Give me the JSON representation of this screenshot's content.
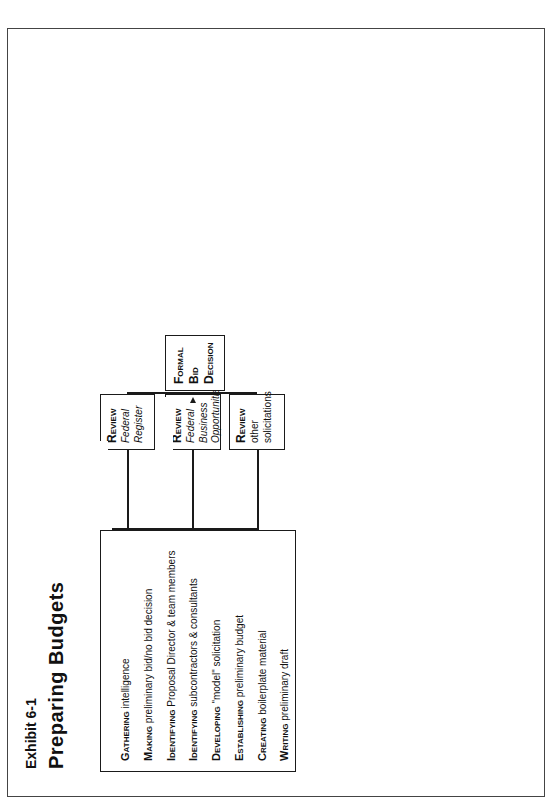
{
  "header": {
    "exhibit": "Exhibit 6-1",
    "title": "Preparing Budgets"
  },
  "preliminary_list": [
    {
      "verb": "Gathering",
      "rest": " intelligence"
    },
    {
      "verb": "Making",
      "rest": " preliminary bid/no bid decision"
    },
    {
      "verb": "Identifying",
      "rest": " Proposal Director & team members"
    },
    {
      "verb": "Identifying",
      "rest": " subcontractors & consultants"
    },
    {
      "verb": "Developing",
      "rest": " \"model\" solicitation"
    },
    {
      "verb": "Establishing",
      "rest": " preliminary budget"
    },
    {
      "verb": "Creating",
      "rest": " boilerplate material"
    },
    {
      "verb": "Writing",
      "rest": " preliminary draft"
    }
  ],
  "review_boxes": [
    {
      "verb": "Review",
      "detail": "Federal Register",
      "italic": true
    },
    {
      "verb": "Review",
      "detail": "Federal Business Opportunities",
      "italic": true
    },
    {
      "verb": "Review",
      "detail": "other solicitations",
      "italic": false
    }
  ],
  "decision": {
    "formal": [
      "Formal",
      "Bid",
      "Decision"
    ],
    "bid": "Bid",
    "no_bid": "No Bid",
    "recommend": {
      "verb": "Recommend",
      "detail": "RFP/RFA to other organizations"
    }
  },
  "bid_actions": [
    {
      "verb": "Determine",
      "detail": "availability of writers and reviewers"
    },
    {
      "verb": "Distribute",
      "detail": "RFP/RFA and proposal prospectus"
    },
    {
      "verb": "Prepare",
      "detail": "proposal compliance checklist, outline & schedule"
    }
  ],
  "strategy_meeting": {
    "title": "Strategy Meeting",
    "items": [
      {
        "verb": "Proposal",
        "rest": " prospectus"
      },
      {
        "verb": "Compliance",
        "rest": " checklist"
      },
      {
        "verb": "Proposal",
        "rest": " outline and schedule"
      },
      {
        "verb": "Subcontractor/Consultant",
        "rest": " roles"
      },
      {
        "verb": "Proposal",
        "rest": " themes"
      },
      {
        "verb": "Budget",
        "rest": " assumptions"
      },
      {
        "verb": "Questions",
        "rest": " to Government"
      }
    ]
  },
  "writing": {
    "lines": [
      {
        "verb": "Writing",
        "rest": " narrative"
      },
      {
        "verb": "Reviewing",
        "rest": " narrative"
      },
      {
        "verb": "Rewriting",
        "rest": " narrative"
      }
    ]
  },
  "budget": {
    "lines": [
      {
        "verb": "Developing",
        "rest": " budget"
      },
      {
        "verb": "Reviewing",
        "rest": " budget"
      },
      {
        "verb": "Revising",
        "rest": " budget"
      }
    ]
  },
  "final_review": {
    "lines": [
      "Final Review",
      "Sign Off",
      "Editing"
    ]
  },
  "producing": {
    "lines": [
      "Producing",
      "Reproducing",
      "Packaging",
      "Delivering"
    ]
  },
  "debriefing": {
    "lines": [
      "Debriefing",
      "Meeting"
    ],
    "detail": "(anticipate deficiencies)"
  },
  "negotiations": "Negotiations",
  "award": "Award",
  "non_award": [
    "Non",
    "Award"
  ],
  "review_notice": {
    "verb": "Review",
    "detail": "Notice of Award/ Contract"
  },
  "request": {
    "verb": "Request",
    "detail": "debriefing and/or winning proposal(s)"
  },
  "start": {
    "verb": "Start",
    "detail": "project"
  },
  "closeout": {
    "lines": [
      "Report",
      "Audit",
      "Close out"
    ]
  },
  "colors": {
    "ink": "#1a1a1a",
    "dark_box": "#0a0a0a",
    "paper": "#ffffff"
  }
}
